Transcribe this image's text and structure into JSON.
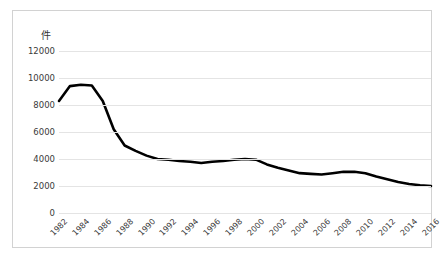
{
  "title_faint": "—  ———  ———",
  "axis": {
    "y_unit": "件",
    "y_ticks": [
      "12000",
      "10000",
      "8000",
      "6000",
      "4000",
      "2000",
      "0"
    ],
    "x_ticks": [
      "1982",
      "1984",
      "1986",
      "1988",
      "1990",
      "1992",
      "1994",
      "1996",
      "1998",
      "2000",
      "2002",
      "2004",
      "2006",
      "2008",
      "2010",
      "2012",
      "2014",
      "2016"
    ]
  },
  "colors": {
    "line": "#000000",
    "grid": "#e4e4e4",
    "frame": "#d2d2d2",
    "text": "#3a3a3a"
  },
  "chart_data": {
    "type": "line",
    "title": "",
    "xlabel": "",
    "ylabel": "件",
    "ylim": [
      0,
      12000
    ],
    "ytick_step": 2000,
    "grid": true,
    "legend": "none",
    "x": [
      1982,
      1983,
      1984,
      1985,
      1986,
      1987,
      1988,
      1989,
      1990,
      1991,
      1992,
      1993,
      1994,
      1995,
      1996,
      1997,
      1998,
      1999,
      2000,
      2001,
      2002,
      2003,
      2004,
      2005,
      2006,
      2007,
      2008,
      2009,
      2010,
      2011,
      2012,
      2013,
      2014,
      2015,
      2016
    ],
    "series": [
      {
        "name": "件数",
        "values": [
          8300,
          9400,
          9500,
          9450,
          8300,
          6200,
          5000,
          4600,
          4250,
          4000,
          3950,
          3850,
          3800,
          3700,
          3800,
          3850,
          3950,
          4000,
          3950,
          3600,
          3350,
          3150,
          2950,
          2900,
          2850,
          2950,
          3050,
          3050,
          2950,
          2700,
          2500,
          2300,
          2150,
          2050,
          2000
        ]
      }
    ]
  }
}
